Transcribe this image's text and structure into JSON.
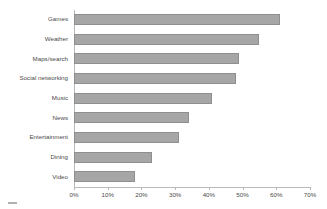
{
  "chart_data": {
    "type": "bar",
    "orientation": "horizontal",
    "title": "",
    "xlabel": "",
    "ylabel": "",
    "categories": [
      "Games",
      "Weather",
      "Maps/search",
      "Social networking",
      "Music",
      "News",
      "Entertainment",
      "Dining",
      "Video"
    ],
    "values": [
      61,
      55,
      49,
      48,
      41,
      34,
      31,
      23,
      18
    ],
    "xlim": [
      0,
      70
    ],
    "xticks": [
      0,
      10,
      20,
      30,
      40,
      50,
      60,
      70
    ],
    "xtick_labels": [
      "0%",
      "10%",
      "20%",
      "30%",
      "40%",
      "50%",
      "60%",
      "70%"
    ],
    "grid": false,
    "legend": null,
    "bar_color": "#a6a6a6",
    "bar_border_color": "#8f8f8f",
    "axis_color": "#b9b9b9",
    "text_color": "#4a4a4a",
    "background": "#ffffff"
  }
}
